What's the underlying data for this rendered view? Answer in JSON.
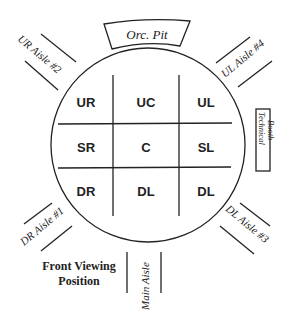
{
  "diagram": {
    "type": "theater-in-the-round stage layout",
    "stage_areas": {
      "row1": [
        "UR",
        "UC",
        "UL"
      ],
      "row2": [
        "SR",
        "C",
        "SL"
      ],
      "row3": [
        "DR",
        "DL",
        "DL"
      ]
    },
    "orchestra_pit": "Orc. Pit",
    "technical_booth": {
      "line1": "Technical",
      "line2": "Booth"
    },
    "aisles": {
      "ur": "UR Aisle #2",
      "ul": "UL Aisle #4",
      "dr": "DR Aisle #1",
      "dl": "DL Aisle #3",
      "main": "Main Aisle"
    },
    "front_viewing": {
      "line1": "Front Viewing",
      "line2": "Position"
    },
    "colors": {
      "ink": "#222222",
      "background": "#ffffff"
    }
  }
}
